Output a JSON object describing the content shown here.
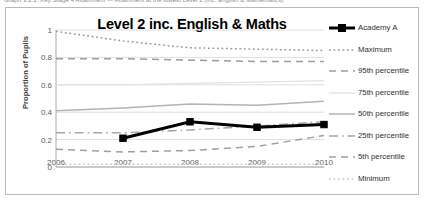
{
  "caption": "Graph 3.2.1: Key Stage 4 Attainment — Attainment at the lowest Level 2 (inc. English & Mathematics)",
  "chart": {
    "title": "Level 2 inc. English & Maths",
    "ylabel": "Proportion of Pupils"
  },
  "chart_data": {
    "type": "line",
    "title": "Level 2 inc. English & Maths",
    "xlabel": "",
    "ylabel": "Proportion of Pupils",
    "x": [
      "2006",
      "2007",
      "2008",
      "2009",
      "2010"
    ],
    "ylim": [
      0,
      1
    ],
    "yticks": [
      "0",
      "0.2",
      "0.4",
      "0.6",
      "0.8",
      "1"
    ],
    "grid": true,
    "legend_position": "right",
    "series": [
      {
        "name": "Academy A",
        "style": "solid-thick-marker",
        "color": "#000000",
        "values": [
          null,
          0.21,
          0.33,
          0.29,
          0.31
        ]
      },
      {
        "name": "Maximum",
        "style": "dotted",
        "color": "#9a9a9a",
        "values": [
          0.99,
          0.92,
          0.87,
          0.86,
          0.85
        ]
      },
      {
        "name": "95th percentile",
        "style": "dashed",
        "color": "#9d9d9d",
        "values": [
          0.79,
          0.79,
          0.78,
          0.77,
          0.77
        ]
      },
      {
        "name": "75th percentile",
        "style": "solid-faint",
        "color": "#e2e2e2",
        "values": [
          0.6,
          0.6,
          0.61,
          0.62,
          0.63
        ]
      },
      {
        "name": "50th percentile",
        "style": "solid",
        "color": "#b4b4b4",
        "values": [
          0.41,
          0.43,
          0.46,
          0.45,
          0.48
        ]
      },
      {
        "name": "25th  percentile",
        "style": "dash-dot",
        "color": "#a8a8a8",
        "values": [
          0.25,
          0.25,
          0.27,
          0.3,
          0.33
        ]
      },
      {
        "name": "5th percentile",
        "style": "dashed",
        "color": "#a0a0a0",
        "values": [
          0.13,
          0.11,
          0.12,
          0.15,
          0.23
        ]
      },
      {
        "name": "Minimum",
        "style": "dotted",
        "color": "#c9c9c9",
        "values": [
          0.02,
          0.02,
          0.02,
          0.02,
          0.02
        ]
      }
    ]
  }
}
